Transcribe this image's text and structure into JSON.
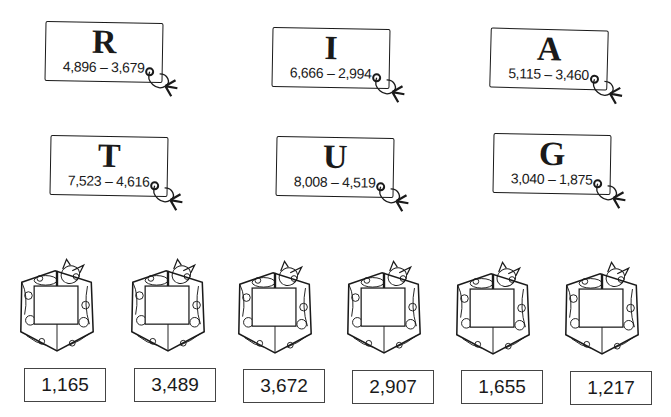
{
  "tags": [
    {
      "letter": "R",
      "problem": "4,896 – 3,679"
    },
    {
      "letter": "I",
      "problem": "6,666 – 2,994"
    },
    {
      "letter": "A",
      "problem": "5,115 – 3,460"
    },
    {
      "letter": "T",
      "problem": "7,523 – 4,616"
    },
    {
      "letter": "U",
      "problem": "8,008 – 4,519"
    },
    {
      "letter": "G",
      "problem": "3,040 – 1,875"
    }
  ],
  "answers": [
    "1,165",
    "3,489",
    "3,672",
    "2,907",
    "1,655",
    "1,217"
  ],
  "gift_count": 6
}
